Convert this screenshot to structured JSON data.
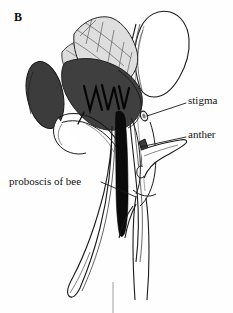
{
  "figure": {
    "panel_letter": "B",
    "style": "line-drawing",
    "background_color": "#fefefe",
    "ink_color": "#111111",
    "colors": {
      "bee_body": "#3f3f3f",
      "bee_body_dark": "#2b2b2b",
      "wing_fill": "#d9d9d9",
      "wing_vein": "#4a4a4a",
      "leg_black": "#050505",
      "petal_white": "#ffffff",
      "outline": "#1a1a1a"
    }
  },
  "labels": {
    "stigma": {
      "text": "stigma",
      "text_x": 188,
      "text_y": 94,
      "leader_from_x": 186,
      "leader_from_y": 103,
      "leader_to_x": 147,
      "leader_to_y": 116
    },
    "anther": {
      "text": "anther",
      "text_x": 188,
      "text_y": 128,
      "leader_from_x": 186,
      "leader_from_y": 137,
      "leader_to_x": 140,
      "leader_to_y": 147
    },
    "proboscis": {
      "text": "proboscis of bee",
      "text_x": 9,
      "text_y": 175,
      "leader_from_x": 101,
      "leader_from_y": 182,
      "leader_to_x": 136,
      "leader_to_y": 197
    }
  },
  "parts": {
    "bee_abdomen": "bee-abdomen",
    "bee_thorax": "bee-thorax",
    "bee_forewing": "bee-forewing",
    "bee_hindwing": "bee-hindwing",
    "bee_legs": "bee-legs",
    "banner_petal": "banner-petal",
    "wing_petal": "wing-petal",
    "keel_petal": "keel-petal",
    "sepal_lobe": "sepal-lobe",
    "stigma_organ": "stigma",
    "anther_organ": "anther",
    "ovule": "ovule",
    "pedicel": "pedicel"
  }
}
